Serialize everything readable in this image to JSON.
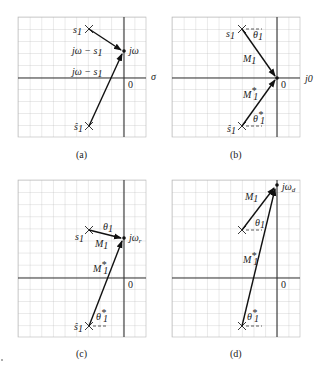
{
  "panels": [
    {
      "id": "a",
      "caption": "(a)",
      "labels": {
        "s1": "s",
        "s1_sub": "1",
        "s1hat": "ŝ",
        "s1hat_sub": "1",
        "point": "jω",
        "vec1": "jω − s",
        "vec1_sub": "1",
        "vec2": "jω − s",
        "vec2_sub": "1",
        "origin": "0",
        "axis": "σ"
      }
    },
    {
      "id": "b",
      "caption": "(b)",
      "labels": {
        "s1": "s",
        "s1_sub": "1",
        "s1hat": "ŝ",
        "s1hat_sub": "1",
        "theta1": "θ",
        "theta1_sub": "1",
        "theta1s": "θ",
        "theta1s_sub": "1",
        "theta1s_sup": "*",
        "M1": "M",
        "M1_sub": "1",
        "M1s": "M",
        "M1s_sub": "1",
        "M1s_sup": "*",
        "origin": "0",
        "point": "j0"
      }
    },
    {
      "id": "c",
      "caption": "(c)",
      "labels": {
        "s1": "s",
        "s1_sub": "1",
        "s1hat": "ŝ",
        "s1hat_sub": "1",
        "theta1": "θ",
        "theta1_sub": "1",
        "theta1s": "θ",
        "theta1s_sub": "1",
        "theta1s_sup": "*",
        "M1": "M",
        "M1_sub": "1",
        "M1s": "M",
        "M1s_sub": "1",
        "M1s_sup": "*",
        "origin": "0",
        "point": "jω",
        "point_sub": "r"
      }
    },
    {
      "id": "d",
      "caption": "(d)",
      "labels": {
        "theta1": "θ",
        "theta1_sub": "1",
        "theta1s": "θ",
        "theta1s_sub": "1",
        "theta1s_sup": "*",
        "M1": "M",
        "M1_sub": "1",
        "M1s": "M",
        "M1s_sub": "1",
        "M1s_sup": "*",
        "origin": "0",
        "point": "jω",
        "point_sub": "d"
      }
    }
  ],
  "colors": {
    "grid": "#b8b8b8",
    "axis": "#333333",
    "vector": "#111111"
  }
}
